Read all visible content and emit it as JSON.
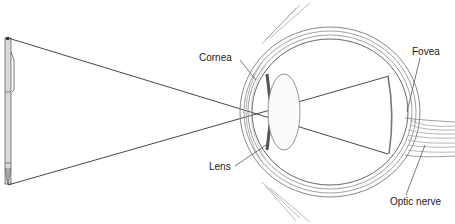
{
  "diagram": {
    "object": "pen",
    "labels": {
      "cornea": "Cornea",
      "lens": "Lens",
      "fovea": "Fovea",
      "optic_nerve": "Optic nerve"
    }
  }
}
